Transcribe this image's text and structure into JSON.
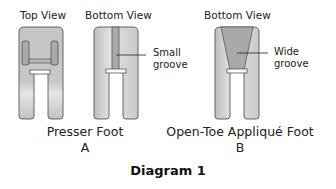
{
  "diagram": {
    "title": "Diagram 1",
    "feet": [
      {
        "name": "Presser Foot",
        "letter": "A",
        "views": [
          {
            "label": "Top View"
          },
          {
            "label": "Bottom View",
            "callout": [
              "Small",
              "groove"
            ]
          }
        ]
      },
      {
        "name": "Open-Toe Appliqué Foot",
        "letter": "B",
        "views": [
          {
            "label": "Bottom View",
            "callout": [
              "Wide",
              "groove"
            ]
          }
        ]
      }
    ],
    "colors": {
      "foot_fill": "#c8c8c8",
      "foot_light": "#e8e8e8",
      "groove": "#a9a9a9",
      "outline": "#555555"
    }
  }
}
